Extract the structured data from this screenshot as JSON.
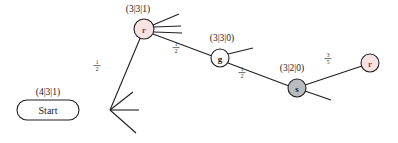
{
  "diagram": {
    "background": "#ffffff",
    "edge_color": "#1f1f1f",
    "node_stroke": "#1f1f1f",
    "colors": {
      "pink_fill": "#f7e2e4",
      "pink_text": "#b03a3a",
      "grey_fill": "#b9bcbf",
      "white_fill": "#ffffff",
      "dark_text": "#1a1a1a"
    },
    "nodes": [
      {
        "id": "start",
        "shape": "rounded-rect",
        "label": "Start",
        "tuple": "(4|3|1)",
        "fill": "#ffffff",
        "text_color": "#1a1a1a",
        "x": 48,
        "y": 110,
        "w": 62,
        "h": 20,
        "tuple_x": 48,
        "tuple_y": 94
      },
      {
        "id": "r1",
        "shape": "circle",
        "label": "r",
        "tuple": "(3|3|1)",
        "fill": "#f7e2e4",
        "text_color": "#b03a3a",
        "x": 144,
        "y": 29,
        "r": 10,
        "tuple_x": 138,
        "tuple_y": 11
      },
      {
        "id": "g1",
        "shape": "circle",
        "label": "g",
        "tuple": "(3|3|0)",
        "fill": "#fcfbfb",
        "text_color": "#1a1a1a",
        "x": 220,
        "y": 58,
        "r": 9,
        "tuple_x": 222,
        "tuple_y": 39
      },
      {
        "id": "s1",
        "shape": "circle",
        "label": "s",
        "tuple": "(3|2|0)",
        "fill": "#b9bcbf",
        "text_color": "#1a1a1a",
        "x": 297,
        "y": 88,
        "r": 9,
        "tuple_x": 292,
        "tuple_y": 69
      },
      {
        "id": "r2",
        "shape": "circle",
        "label": "r",
        "tuple": "",
        "fill": "#f7e2e4",
        "text_color": "#b03a3a",
        "x": 370,
        "y": 63,
        "r": 9,
        "tuple_x": 0,
        "tuple_y": 0
      }
    ],
    "edges": [
      {
        "id": "start-r1",
        "from": "start",
        "to": "r1",
        "label_num": "1",
        "label_den": "2",
        "label_x": 97,
        "label_y": 67
      },
      {
        "id": "r1-g1",
        "from": "r1",
        "to": "g1",
        "label_num": "1",
        "label_den": "2",
        "label_x": 176,
        "label_y": 49
      },
      {
        "id": "g1-s1",
        "from": "g1",
        "to": "s1",
        "label_num": "1",
        "label_den": "2",
        "label_x": 242,
        "label_y": 74
      },
      {
        "id": "s1-r2",
        "from": "s1",
        "to": "r2",
        "label_num": "3",
        "label_den": "5",
        "label_x": 328,
        "label_y": 60
      }
    ],
    "stubs": [
      {
        "id": "start-stub-up",
        "x1": 110,
        "y1": 110,
        "x2": 133,
        "y2": 93
      },
      {
        "id": "start-stub-mid",
        "x1": 110,
        "y1": 110,
        "x2": 138,
        "y2": 110
      },
      {
        "id": "start-stub-down",
        "x1": 110,
        "y1": 110,
        "x2": 135,
        "y2": 132
      },
      {
        "id": "r1-stub-up",
        "x1": 154,
        "y1": 29,
        "x2": 178,
        "y2": 17
      },
      {
        "id": "r1-stub-mid",
        "x1": 154,
        "y1": 27,
        "x2": 180,
        "y2": 26
      },
      {
        "id": "r1-stub-low",
        "x1": 154,
        "y1": 33,
        "x2": 181,
        "y2": 33
      },
      {
        "id": "g1-stub",
        "x1": 229,
        "y1": 55,
        "x2": 254,
        "y2": 49
      },
      {
        "id": "s1-stub",
        "x1": 306,
        "y1": 91,
        "x2": 330,
        "y2": 99
      }
    ]
  }
}
